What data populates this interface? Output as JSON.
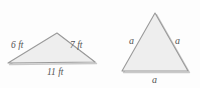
{
  "figure": {
    "name": "two-triangles-comparison",
    "background_color": "#fdfdfd",
    "fill_color": "#eeeeee",
    "stroke_color": "#9a9a9a",
    "label_color": "#555555",
    "shapes": [
      {
        "id": "scalene-triangle",
        "type": "triangle",
        "variant": "scalene",
        "vertices": [
          {
            "x": 8,
            "y": 63
          },
          {
            "x": 57,
            "y": 33
          },
          {
            "x": 95,
            "y": 62
          }
        ],
        "labels": {
          "left_side": "6 ft",
          "right_side": "7 ft",
          "base": "11 ft"
        }
      },
      {
        "id": "equilateral-triangle",
        "type": "triangle",
        "variant": "equilateral",
        "vertices": [
          {
            "x": 122,
            "y": 71
          },
          {
            "x": 155,
            "y": 13
          },
          {
            "x": 188,
            "y": 71
          }
        ],
        "labels": {
          "left_side": "a",
          "right_side": "a",
          "base": "a"
        }
      }
    ]
  }
}
